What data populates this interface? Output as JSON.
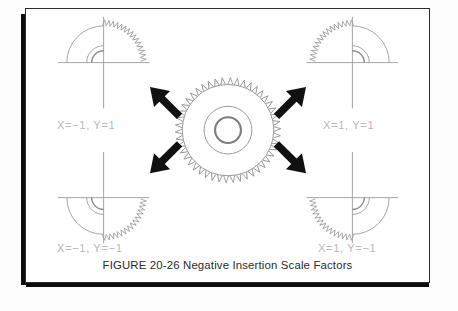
{
  "figure": {
    "caption": "FIGURE 20-26  Negative Insertion Scale Factors",
    "caption_number": "20-26",
    "caption_title": "Negative Insertion Scale Factors",
    "background_color": "#ffffff",
    "border_color": "#2c2c2c",
    "shadow_color": "#0d0d0d",
    "label_color": "#b9b9b9",
    "line_color": "#9a9a9a",
    "arrow_color": "#111111"
  },
  "quadrants": [
    {
      "id": "top-left",
      "label": "X=−1,  Y=1",
      "x_scale": "-1",
      "y_scale": "1",
      "gear_quadrant": "upper-left"
    },
    {
      "id": "top-right",
      "label": "X=1,  Y=1",
      "x_scale": "1",
      "y_scale": "1",
      "gear_quadrant": "upper-right"
    },
    {
      "id": "bottom-left",
      "label": "X=−1,  Y=−1",
      "x_scale": "-1",
      "y_scale": "-1",
      "gear_quadrant": "lower-left"
    },
    {
      "id": "bottom-right",
      "label": "X=1,  Y=−1",
      "x_scale": "1",
      "y_scale": "-1",
      "gear_quadrant": "lower-right"
    }
  ],
  "center_gear": {
    "teeth": 46,
    "has_hub_bore": true,
    "has_rim_circle": true
  },
  "arrows": [
    {
      "id": "arrow-up-left",
      "direction": "up-left"
    },
    {
      "id": "arrow-up-right",
      "direction": "up-right"
    },
    {
      "id": "arrow-down-left",
      "direction": "down-left"
    },
    {
      "id": "arrow-down-right",
      "direction": "down-right"
    }
  ]
}
